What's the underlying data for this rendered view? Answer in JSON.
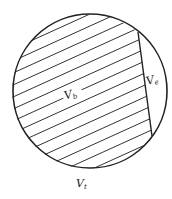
{
  "diagram": {
    "type": "venn-like circle partition",
    "colors": {
      "stroke": "#222222",
      "hatch": "#333333",
      "background": "#ffffff"
    },
    "regions": {
      "bulk": {
        "label_main": "V",
        "label_sub": "b"
      },
      "segment": {
        "label_main": "V",
        "label_sub": "e"
      },
      "total": {
        "label_main": "V",
        "label_sub": "t"
      }
    }
  }
}
